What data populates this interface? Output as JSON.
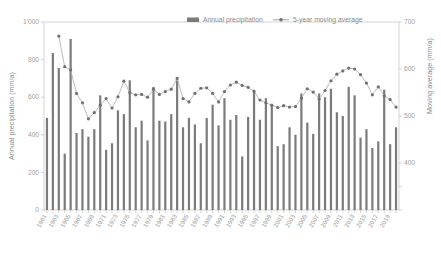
{
  "chart_data": {
    "type": "bar",
    "title": "",
    "xlabel": "",
    "ylabel": "Annual precipitation (mm/a)",
    "y2label": "Moving average (mm/a)",
    "ylim": [
      0,
      1000
    ],
    "y2lim": [
      300,
      700
    ],
    "yticks": [
      "0",
      "200",
      "400",
      "600",
      "800",
      "1'000"
    ],
    "ytick_values": [
      0,
      200,
      400,
      600,
      800,
      1000
    ],
    "y2ticks": [
      "400",
      "500",
      "600",
      "700"
    ],
    "y2tick_values": [
      400,
      500,
      600,
      700
    ],
    "grid": false,
    "legend_position": "top-center",
    "legend": [
      {
        "name": "Annual precipitation",
        "marker": "bar",
        "color": "#7b7b7b"
      },
      {
        "name": "5-year moving average",
        "marker": "line-dot",
        "color": "#9a9a9a"
      }
    ],
    "categories": [
      "1961",
      "1962",
      "1963",
      "1964",
      "1965",
      "1966",
      "1967",
      "1968",
      "1969",
      "1970",
      "1971",
      "1972",
      "1973",
      "1974",
      "1975",
      "1976",
      "1977",
      "1978",
      "1979",
      "1980",
      "1981",
      "1982",
      "1983",
      "1984",
      "1985",
      "1986",
      "1987",
      "1988",
      "1989",
      "1990",
      "1991",
      "1992",
      "1993",
      "1994",
      "1995",
      "1996",
      "1997",
      "1998",
      "1999",
      "2000",
      "2001",
      "2002",
      "2003",
      "2004",
      "2005",
      "2006",
      "2007",
      "2008",
      "2009",
      "2010",
      "2011",
      "2012",
      "2013",
      "2014",
      "2015",
      "2016",
      "2017",
      "2018",
      "2019",
      "2020"
    ],
    "xtick_labels": [
      "1961",
      "1963",
      "1965",
      "1967",
      "1969",
      "1971",
      "1973",
      "1975",
      "1977",
      "1979",
      "1981",
      "1983",
      "1985",
      "1987",
      "1989",
      "1991",
      "1993",
      "1995",
      "1997",
      "1999",
      "2001",
      "2003",
      "2005",
      "2007",
      "2009",
      "2011",
      "2013",
      "2015",
      "2017",
      "2019"
    ],
    "series": [
      {
        "name": "Annual precipitation",
        "axis": "left",
        "values": [
          490,
          835,
          755,
          300,
          910,
          410,
          430,
          390,
          430,
          610,
          320,
          355,
          530,
          510,
          690,
          440,
          475,
          370,
          655,
          475,
          470,
          510,
          690,
          440,
          490,
          455,
          355,
          490,
          560,
          450,
          595,
          480,
          505,
          285,
          495,
          640,
          480,
          595,
          555,
          340,
          350,
          440,
          400,
          620,
          465,
          405,
          620,
          600,
          645,
          520,
          500,
          655,
          610,
          385,
          430,
          330,
          365,
          640,
          350,
          440
        ]
      },
      {
        "name": "5-year moving average",
        "axis": "right",
        "values": [
          null,
          null,
          670,
          605,
          598,
          548,
          528,
          494,
          507,
          523,
          537,
          517,
          541,
          574,
          550,
          545,
          546,
          540,
          557,
          546,
          552,
          557,
          580,
          537,
          530,
          548,
          559,
          560,
          548,
          530,
          552,
          566,
          572,
          565,
          561,
          552,
          534,
          528,
          523,
          518,
          522,
          519,
          520,
          538,
          558,
          551,
          536,
          554,
          575,
          589,
          596,
          602,
          600,
          588,
          570,
          545,
          562,
          543,
          535,
          519
        ]
      }
    ]
  }
}
